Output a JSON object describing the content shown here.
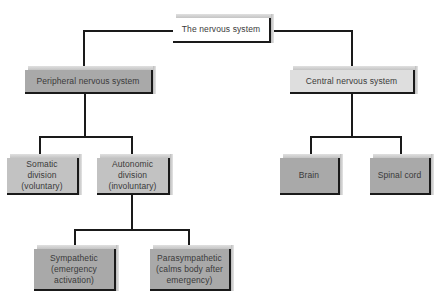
{
  "diagram": {
    "title": "The nervous system",
    "nodes": {
      "root": {
        "label": "The nervous system"
      },
      "peripheral": {
        "label": "Peripheral nervous system"
      },
      "central": {
        "label": "Central nervous system"
      },
      "somatic": {
        "label": "Somatic division (voluntary)",
        "line1": "Somatic",
        "line2": "division",
        "line3": "(voluntary)"
      },
      "autonomic": {
        "label": "Autonomic division (involuntary)",
        "line1": "Autonomic",
        "line2": "division",
        "line3": "(involuntary)"
      },
      "brain": {
        "label": "Brain"
      },
      "spinal_cord": {
        "label": "Spinal cord"
      },
      "sympathetic": {
        "label": "Sympathetic (emergency activation)",
        "line1": "Sympathetic",
        "line2": "(emergency",
        "line3": "activation)"
      },
      "parasympathetic": {
        "label": "Parasympathetic (calms body after emergency)",
        "line1": "Parasympathetic",
        "line2": "(calms body after",
        "line3": "emergency)"
      }
    },
    "edges": [
      [
        "The nervous system",
        "Peripheral nervous system"
      ],
      [
        "The nervous system",
        "Central nervous system"
      ],
      [
        "Peripheral nervous system",
        "Somatic division (voluntary)"
      ],
      [
        "Peripheral nervous system",
        "Autonomic division (involuntary)"
      ],
      [
        "Autonomic division (involuntary)",
        "Sympathetic (emergency activation)"
      ],
      [
        "Autonomic division (involuntary)",
        "Parasympathetic (calms body after emergency)"
      ],
      [
        "Central nervous system",
        "Brain"
      ],
      [
        "Central nervous system",
        "Spinal cord"
      ]
    ],
    "colors": {
      "root": "#ffffff",
      "peripheral": "#a9a9a9",
      "central": "#dedede",
      "somatic": "#c2c2c2",
      "autonomic": "#c2c2c2",
      "brain": "#a9a9a9",
      "spinal_cord": "#a9a9a9",
      "sympathetic": "#a9a9a9",
      "parasympathetic": "#a9a9a9",
      "lines": "#1a1a1a"
    }
  }
}
